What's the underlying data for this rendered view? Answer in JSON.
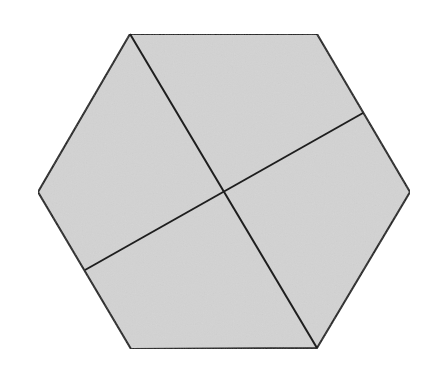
{
  "diagram": {
    "shape": "hexagon",
    "fill_color": "#d3d3d3",
    "stroke_color": "#1e1e1e",
    "background_color": "#ffffff",
    "vertices": [
      [
        130,
        34
      ],
      [
        317,
        34
      ],
      [
        410,
        192
      ],
      [
        317,
        348
      ],
      [
        131,
        349
      ],
      [
        38,
        192
      ]
    ],
    "dividing_lines": [
      {
        "name": "diagonal-top-left-to-bottom-right",
        "from": [
          130,
          34
        ],
        "to": [
          317,
          348
        ]
      },
      {
        "name": "segment-left-edge-to-right-edge",
        "from": [
          85,
          270
        ],
        "to": [
          363,
          113
        ]
      }
    ],
    "intersection": [
      224,
      191
    ],
    "region_count": 4
  }
}
